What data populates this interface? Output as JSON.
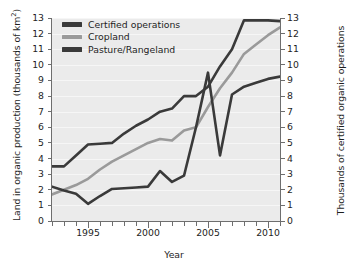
{
  "chart_data": {
    "type": "line",
    "title": "",
    "xlabel": "Year",
    "ylabel": "Land in organic production (thousands of km²)",
    "ylabel_right": "Thousands of certified organic operations",
    "xlim": [
      1992,
      2011
    ],
    "ylim": [
      0,
      13
    ],
    "ylim_right": [
      0,
      13
    ],
    "grid": true,
    "legend_position": "top-left",
    "x": [
      1992,
      1993,
      1994,
      1995,
      1996,
      1997,
      1998,
      1999,
      2000,
      2001,
      2002,
      2003,
      2004,
      2005,
      2006,
      2007,
      2008,
      2009,
      2010,
      2011
    ],
    "yticks": [
      0,
      1,
      2,
      3,
      4,
      5,
      6,
      7,
      8,
      9,
      10,
      11,
      12,
      13
    ],
    "yticklabels": [
      "0",
      "1",
      "2",
      "3",
      "4",
      "5",
      "6",
      "7",
      "8",
      "9",
      "10",
      "11",
      "12",
      "13"
    ],
    "yticks_right": [
      0,
      1,
      2,
      3,
      4,
      5,
      6,
      7,
      8,
      9,
      10,
      11,
      12,
      13
    ],
    "yticklabels_right": [
      "0",
      "1",
      "2",
      "3",
      "4",
      "5",
      "6",
      "7",
      "8",
      "9",
      "10",
      "11",
      "12",
      "13"
    ],
    "xticks": [
      1992,
      1993,
      1994,
      1995,
      1996,
      1997,
      1998,
      1999,
      2000,
      2001,
      2002,
      2003,
      2004,
      2005,
      2006,
      2007,
      2008,
      2009,
      2010,
      2011
    ],
    "xticklabels_major": [
      "1995",
      "2000",
      "2005",
      "2010"
    ],
    "xticks_major": [
      1995,
      2000,
      2005,
      2010
    ],
    "series": [
      {
        "name": "Certified operations",
        "axis": "right",
        "color": "#3a3a3a",
        "values": [
          3.5,
          3.5,
          4.2,
          4.9,
          4.95,
          5.0,
          5.6,
          6.1,
          6.5,
          7.0,
          7.2,
          8.0,
          8.0,
          8.6,
          9.9,
          11.0,
          12.85,
          12.85,
          12.85,
          12.8
        ]
      },
      {
        "name": "Cropland",
        "axis": "left",
        "color": "#9a9a9a",
        "values": [
          1.7,
          2.0,
          2.3,
          2.7,
          3.3,
          3.8,
          4.2,
          4.6,
          5.0,
          5.25,
          5.15,
          5.8,
          6.0,
          7.3,
          8.5,
          9.5,
          10.7,
          11.3,
          11.9,
          12.4
        ]
      },
      {
        "name": "Pasture/Rangeland",
        "axis": "left",
        "color": "#3a3a3a",
        "values": [
          2.2,
          1.95,
          1.75,
          1.1,
          1.6,
          2.05,
          2.1,
          2.15,
          2.2,
          3.2,
          2.5,
          2.9,
          6.0,
          9.5,
          4.2,
          8.1,
          8.6,
          8.85,
          9.1,
          9.25
        ]
      }
    ]
  },
  "legend": {
    "items": [
      {
        "label": "Certified operations",
        "color": "#3a3a3a"
      },
      {
        "label": "Cropland",
        "color": "#9a9a9a"
      },
      {
        "label": "Pasture/Rangeland",
        "color": "#3a3a3a"
      }
    ]
  },
  "axes": {
    "left_title_main": "Land in organic production (thousands of km",
    "left_title_sup": "2",
    "left_title_tail": ")",
    "right_title": "Thousands of certified organic operations",
    "x_title": "Year"
  },
  "colors": {
    "plot_background": "#ebebeb",
    "gridline": "#f6f6f6",
    "axis": "#6e6e6e",
    "text": "#1e1e1e",
    "dark_series": "#3a3a3a",
    "light_series": "#9a9a9a"
  }
}
